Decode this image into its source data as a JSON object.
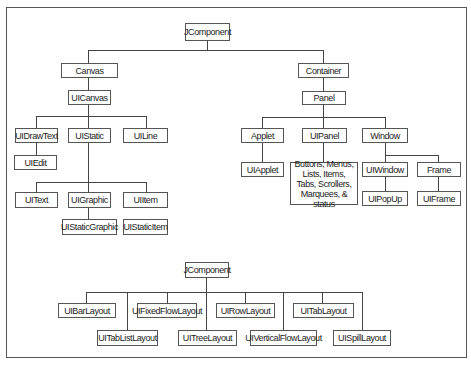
{
  "top_diagram": {
    "root": "JComponent",
    "canvas_branch": {
      "canvas": "Canvas",
      "uicanvas": "UICanvas",
      "uidrawtext": "UIDrawText",
      "uistatic": "UIStatic",
      "uiline": "UILine",
      "uiedit": "UIEdit",
      "uitext": "UIText",
      "uigraphic": "UIGraphic",
      "uiitem": "UIItem",
      "uistaticgraphic": "UIStaticGraphic",
      "uistaticitem": "UIStaticItem"
    },
    "container_branch": {
      "container": "Container",
      "panel": "Panel",
      "applet": "Applet",
      "uipanel": "UIPanel",
      "window": "Window",
      "uiapplet": "UIApplet",
      "panel_children": [
        "Buttons, Menus,",
        "Lists, Items,",
        "Tabs, Scrollers,",
        "Marquees, & status"
      ],
      "uiwindow": "UIWindow",
      "frame": "Frame",
      "uipopup": "UIPopUp",
      "uiframe": "UIFrame"
    }
  },
  "bottom_diagram": {
    "root": "JComponent",
    "layouts": {
      "uibarlayout": "UIBarLayout",
      "uifixedflowlayout": "UIFixedFlowLayout",
      "uirowlayout": "UIRowLayout",
      "uitablayout": "UITabLayout",
      "uitablistlayout": "UITabListLayout",
      "uitreelayout": "UITreeLayout",
      "uiverticalflowlayout": "UIVerticalFlowLayout",
      "uispilllayout": "UISpillLayout"
    }
  },
  "colors": {
    "line": "#444444",
    "border": "#555555",
    "text": "#222222",
    "background": "#ffffff"
  }
}
